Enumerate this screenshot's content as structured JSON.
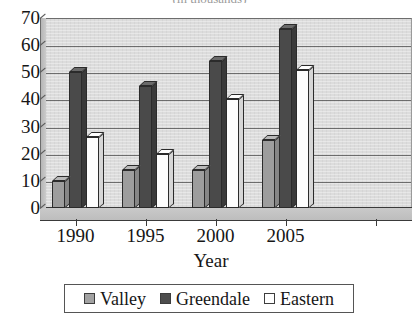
{
  "chart_data": {
    "type": "bar",
    "title": "(in thousands)",
    "subtitle": "",
    "xlabel": "Year",
    "ylabel": "",
    "categories": [
      "1990",
      "1995",
      "2000",
      "2005"
    ],
    "series": [
      {
        "name": "Valley",
        "color": "#9d9d9d",
        "values": [
          10,
          14,
          14,
          25
        ]
      },
      {
        "name": "Greendale",
        "color": "#4a4a4a",
        "values": [
          50,
          45,
          54,
          66
        ]
      },
      {
        "name": "Eastern",
        "color": "#fdfdfd",
        "values": [
          26,
          20,
          40,
          51
        ]
      }
    ],
    "ylim": [
      0,
      70
    ],
    "y_ticks": [
      0,
      10,
      20,
      30,
      40,
      50,
      60,
      70
    ],
    "y_tick_labels": [
      "0",
      "10",
      "20",
      "30",
      "40",
      "50",
      "60",
      "70"
    ],
    "grid": true,
    "grid_axis": "y",
    "legend_position": "bottom",
    "style": "3d-column",
    "plot_background": "#dcdcdc"
  },
  "axes": {
    "y_title": "",
    "x_title": "Year"
  },
  "legend": {
    "items": [
      {
        "label": "Valley",
        "swatch": "swatch-valley"
      },
      {
        "label": "Greendale",
        "swatch": "swatch-greendale"
      },
      {
        "label": "Eastern",
        "swatch": "swatch-eastern"
      }
    ]
  }
}
